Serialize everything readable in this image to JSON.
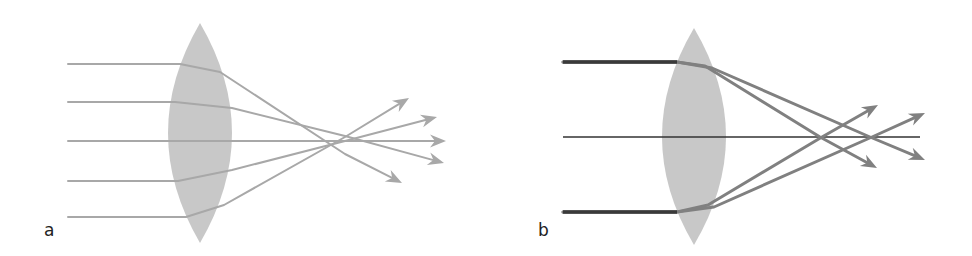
{
  "figure": {
    "panels": [
      {
        "id": "a",
        "label": "a",
        "description": "Converging lens with spherical aberration: parallel rays at different heights focus at different points",
        "lens": {
          "cx": 200,
          "cy": 133,
          "half_width": 32,
          "top": 23,
          "bottom": 243,
          "color": "#c8c8c8"
        },
        "ray_color": "#a8a8a8",
        "rays": [
          {
            "y_in": 64,
            "x_start": 68,
            "pts": [
              [
                68,
                64
              ],
              [
                180,
                64
              ],
              [
                220,
                72
              ],
              [
                345,
                154
              ]
            ],
            "arrow_tip": [
              402,
              183
            ]
          },
          {
            "y_in": 102,
            "x_start": 68,
            "pts": [
              [
                68,
                102
              ],
              [
                175,
                102
              ],
              [
                232,
                108
              ],
              [
                345,
                136
              ]
            ],
            "arrow_tip": [
              444,
              163
            ]
          },
          {
            "y_in": 141,
            "x_start": 68,
            "pts": [
              [
                68,
                141
              ],
              [
                420,
                141
              ]
            ],
            "arrow_tip": [
              446,
              141
            ]
          },
          {
            "y_in": 181,
            "x_start": 68,
            "pts": [
              [
                68,
                181
              ],
              [
                178,
                181
              ],
              [
                232,
                170
              ],
              [
                345,
                141
              ]
            ],
            "arrow_tip": [
              437,
              117
            ]
          },
          {
            "y_in": 217,
            "x_start": 68,
            "pts": [
              [
                68,
                217
              ],
              [
                186,
                217
              ],
              [
                224,
                205
              ],
              [
                345,
                137
              ]
            ],
            "arrow_tip": [
              409,
              98
            ]
          }
        ]
      },
      {
        "id": "b",
        "label": "b",
        "description": "Converging lens with chromatic aberration: each incoming ray splits into two rays focusing at different points on the axis",
        "lens": {
          "cx": 694,
          "cy": 136,
          "half_width": 32,
          "top": 28,
          "bottom": 245,
          "color": "#c8c8c8"
        },
        "axis": {
          "y": 137,
          "x_start": 563,
          "x_end": 920,
          "color": "#333333"
        },
        "incoming_color": "#3a3a3a",
        "ray_color": "#808080",
        "rays": [
          {
            "y_in": 62,
            "pts": [
              [
                563,
                62
              ],
              [
                677,
                62
              ],
              [
                705,
                66
              ],
              [
                820,
                137
              ]
            ],
            "arrow_tip": [
              877,
              168
            ]
          },
          {
            "y_in": 62,
            "pts": [
              [
                563,
                62
              ],
              [
                677,
                62
              ],
              [
                712,
                68
              ],
              [
                870,
                137
              ]
            ],
            "arrow_tip": [
              925,
              160
            ]
          },
          {
            "y_in": 212,
            "pts": [
              [
                563,
                212
              ],
              [
                677,
                212
              ],
              [
                708,
                205
              ],
              [
                822,
                137
              ]
            ],
            "arrow_tip": [
              878,
              105
            ]
          },
          {
            "y_in": 212,
            "pts": [
              [
                563,
                212
              ],
              [
                677,
                212
              ],
              [
                714,
                207
              ],
              [
                872,
                137
              ]
            ],
            "arrow_tip": [
              925,
              113
            ]
          }
        ]
      }
    ]
  }
}
